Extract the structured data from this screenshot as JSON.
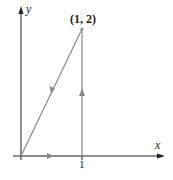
{
  "diagram": {
    "axes": {
      "x_label": "x",
      "y_label": "y"
    },
    "point_label": "(1, 2)",
    "tick_label_x": "1",
    "colors": {
      "axis": "#222222",
      "path": "#8a8a8a",
      "arrow": "#8a8a8a"
    },
    "path": [
      {
        "from": [
          0,
          0
        ],
        "to": [
          1,
          0
        ],
        "direction": "right"
      },
      {
        "from": [
          1,
          0
        ],
        "to": [
          1,
          2
        ],
        "direction": "up"
      },
      {
        "from": [
          1,
          2
        ],
        "to": [
          0,
          0
        ],
        "direction": "down-left"
      }
    ]
  }
}
